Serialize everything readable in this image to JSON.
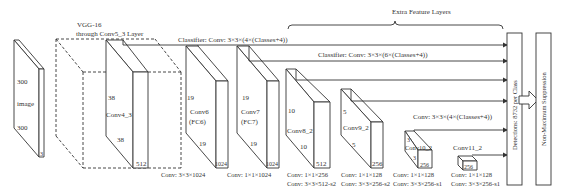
{
  "vgg": {
    "line1": "VGG-16",
    "line2": "through Conv5_3 Layer"
  },
  "extra_label": "Extra Feature Layers",
  "image": {
    "label": "image",
    "h": "300",
    "w": "300",
    "c": "3"
  },
  "blocks": [
    {
      "name": "Conv4_3",
      "h": "38",
      "w": "38",
      "c": "512"
    },
    {
      "name": "Conv6",
      "sub": "(FC6)",
      "h": "19",
      "w": "19",
      "c": "1024",
      "conv1": "Conv: 3×3×1024"
    },
    {
      "name": "Conv7",
      "sub": "(FC7)",
      "h": "19",
      "w": "19",
      "c": "1024",
      "conv1": "Conv: 1×1×1024"
    },
    {
      "name": "Conv8_2",
      "h": "10",
      "w": "10",
      "c": "512",
      "conv1": "Conv: 1×1×256",
      "conv2": "Conv: 3×3×512-s2"
    },
    {
      "name": "Conv9_2",
      "h": "5",
      "w": "5",
      "c": "256",
      "conv1": "Conv: 1×1×128",
      "conv2": "Conv: 3×3×256-s2"
    },
    {
      "name": "Conv10_2",
      "h": "3",
      "w": "3",
      "c": "256",
      "conv1": "Conv: 1×1×128",
      "conv2": "Conv: 3×3×256-s1"
    },
    {
      "name": "Conv11_2",
      "c": "256",
      "conv1": "Conv: 1×1×128",
      "conv2": "Conv: 3×3×256-s1"
    }
  ],
  "classifiers": [
    "Classifier: Conv: 3×3×(4×(Classes+4))",
    "Classifier: Conv: 3×3×(6×(Classes+4))",
    "Conv: 3×3×(4×(Classes+4))"
  ],
  "detections": "Detections: 8732 per Class",
  "nms": "Non-Maximum Suppression"
}
